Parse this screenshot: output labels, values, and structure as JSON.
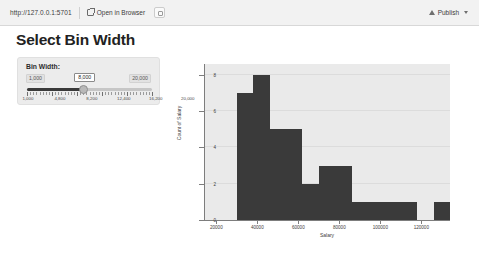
{
  "toolbar": {
    "url": "http://127.0.0.1:5701",
    "open_in_browser_label": "Open in Browser",
    "external_icon": "external-link-icon",
    "copy_icon": "copy-icon",
    "publish_label": "Publish",
    "publish_icon": "publish-upload-icon",
    "caret_icon": "chevron-down-icon"
  },
  "page": {
    "title": "Select Bin Width"
  },
  "slider": {
    "label": "Bin Width:",
    "min_label": "1,000",
    "max_label": "20,000",
    "current_value": "8,000",
    "fill_percent": 45,
    "ticks": [
      {
        "label": "1,000",
        "pos": 0
      },
      {
        "label": "4,800",
        "pos": 20
      },
      {
        "label": "8,200",
        "pos": 40
      },
      {
        "label": "12,400",
        "pos": 60
      },
      {
        "label": "16,200",
        "pos": 80
      },
      {
        "label": "20,000",
        "pos": 100
      }
    ]
  },
  "chart_data": {
    "type": "bar",
    "title": "",
    "xlabel": "Salary",
    "ylabel": "Count of Salary",
    "xlim": [
      14000,
      134000
    ],
    "ylim": [
      0,
      8.6
    ],
    "grid": true,
    "legend": "none",
    "bin_width": 8000,
    "xticks": [
      20000,
      40000,
      60000,
      80000,
      100000,
      120000
    ],
    "yticks": [
      0,
      2,
      4,
      6,
      8
    ],
    "bins": [
      {
        "start": 30000,
        "end": 38000,
        "count": 7
      },
      {
        "start": 38000,
        "end": 46000,
        "count": 8
      },
      {
        "start": 46000,
        "end": 62000,
        "count": 5
      },
      {
        "start": 62000,
        "end": 70000,
        "count": 2
      },
      {
        "start": 70000,
        "end": 86000,
        "count": 3
      },
      {
        "start": 86000,
        "end": 118000,
        "count": 1
      },
      {
        "start": 126000,
        "end": 134000,
        "count": 1
      }
    ]
  }
}
